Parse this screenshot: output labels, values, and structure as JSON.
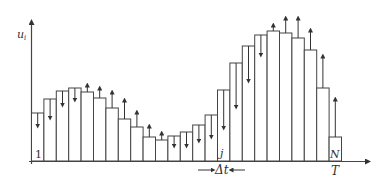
{
  "diagram": {
    "title": "",
    "y_axis_label": "u",
    "y_axis_subscript": "i",
    "x_end_label": "T",
    "first_bar_label": "1",
    "mid_bar_label": "j",
    "last_bar_label": "N",
    "step_label": "Δt",
    "colors": {
      "stroke": "#444444",
      "background": "#ffffff"
    }
  },
  "chart_data": {
    "type": "bar",
    "title": "",
    "xlabel": "T",
    "ylabel": "u_i",
    "bar_count": 25,
    "bar_labels": {
      "1": "1",
      "16": "j",
      "25": "N"
    },
    "bar_tops_px": [
      113,
      99,
      91,
      88,
      92,
      98,
      108,
      119,
      127,
      137,
      140,
      136,
      132,
      125,
      115,
      90,
      63,
      46,
      35,
      31,
      33,
      38,
      50,
      88,
      137
    ],
    "arrow_tips_px": [
      126,
      118,
      105,
      100,
      85,
      88,
      92,
      100,
      112,
      126,
      133,
      146,
      146,
      141,
      137,
      128,
      107,
      81,
      55,
      25,
      18,
      18,
      30,
      56,
      99
    ],
    "arrow_direction": [
      "down",
      "down",
      "down",
      "down",
      "up",
      "up",
      "up",
      "up",
      "up",
      "up",
      "up",
      "down",
      "down",
      "down",
      "down",
      "down",
      "down",
      "down",
      "down",
      "up",
      "up",
      "up",
      "up",
      "up",
      "up"
    ],
    "baseline_px": 161,
    "x0_px": 31.5,
    "bar_width_px": 12.4
  }
}
